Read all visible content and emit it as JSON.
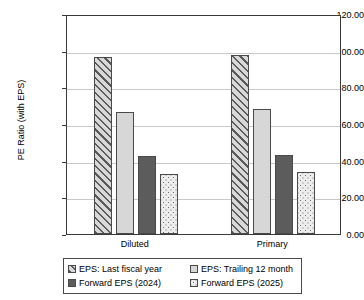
{
  "chart_data": {
    "type": "bar",
    "title": "",
    "xlabel": "",
    "ylabel": "PE Ratio (with EPS)",
    "categories": [
      "Diluted",
      "Primary"
    ],
    "series": [
      {
        "name": "EPS: Last fiscal year",
        "values": [
          96.3,
          97.6
        ],
        "pattern": "diagonal-hatch",
        "color": "#c6c6c6"
      },
      {
        "name": "EPS: Trailing 12 month",
        "values": [
          66.8,
          68.2
        ],
        "pattern": "solid-light",
        "color": "#d7d7d7"
      },
      {
        "name": "Forward EPS (2024)",
        "values": [
          42.6,
          43.2
        ],
        "pattern": "solid-dark",
        "color": "#5c5c5c"
      },
      {
        "name": "Forward EPS (2025)",
        "values": [
          32.7,
          33.6
        ],
        "pattern": "dotted",
        "color": "#ededed"
      }
    ],
    "ylim": [
      0,
      120
    ],
    "ytick_step": 20,
    "ytick_labels": [
      "0.00",
      "20.00",
      "40.00",
      "60.00",
      "80.00",
      "100.00",
      "120.00"
    ],
    "grid": true,
    "legend_position": "bottom"
  },
  "axis": {
    "y_title": "PE Ratio (with EPS)"
  },
  "legend": {
    "items": [
      {
        "label": "EPS: Last fiscal year"
      },
      {
        "label": "EPS: Trailing 12 month"
      },
      {
        "label": "Forward EPS (2024)"
      },
      {
        "label": "Forward EPS (2025)"
      }
    ]
  }
}
